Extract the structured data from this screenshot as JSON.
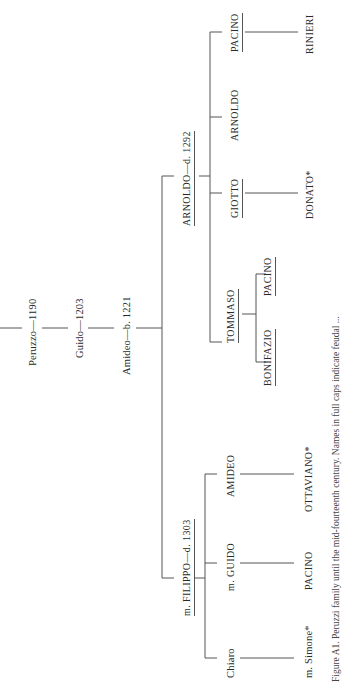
{
  "figure": {
    "caption": "Figure A1. Peruzzi family until the mid-fourteenth century. Names in full caps indicate feudal ...",
    "orientation": "rotated -90deg"
  },
  "tree": {
    "ancestors": [
      {
        "name": "Peruzzo",
        "date": "—1190",
        "label": "Peruzzo—1190"
      },
      {
        "name": "Guido",
        "date": "—1203",
        "label": "Guido—1203"
      },
      {
        "name": "Amideo",
        "date": "—b. 1221",
        "label": "Amideo—b. 1221"
      }
    ],
    "arnoldo_branch": {
      "head": {
        "label": "ARNOLDO—d. 1292",
        "underlined": true
      },
      "children": [
        {
          "label": "TOMMASO",
          "underlined": true,
          "children": [
            {
              "label": "BONIFAZIO",
              "underlined": true
            },
            {
              "label": "PACINO",
              "underlined": true
            }
          ]
        },
        {
          "label": "GIOTTO",
          "underlined": true,
          "children": [
            {
              "label": "DONATO*"
            }
          ]
        },
        {
          "label": "ARNOLDO",
          "underlined": false
        },
        {
          "label": "PACINO",
          "underlined": true,
          "children": [
            {
              "label": "RINIERI"
            }
          ]
        }
      ]
    },
    "filippo_branch": {
      "head": {
        "label": "m. FILIPPO—d. 1303",
        "underlined": true
      },
      "children": [
        {
          "label": "Chiaro",
          "children": [
            {
              "label": "m. Simone*"
            }
          ]
        },
        {
          "label": "m. GUIDO",
          "children": [
            {
              "label": "PACINO"
            }
          ]
        },
        {
          "label": "AMIDEO",
          "children": [
            {
              "label": "OTTAVIANO*"
            }
          ]
        }
      ]
    }
  }
}
